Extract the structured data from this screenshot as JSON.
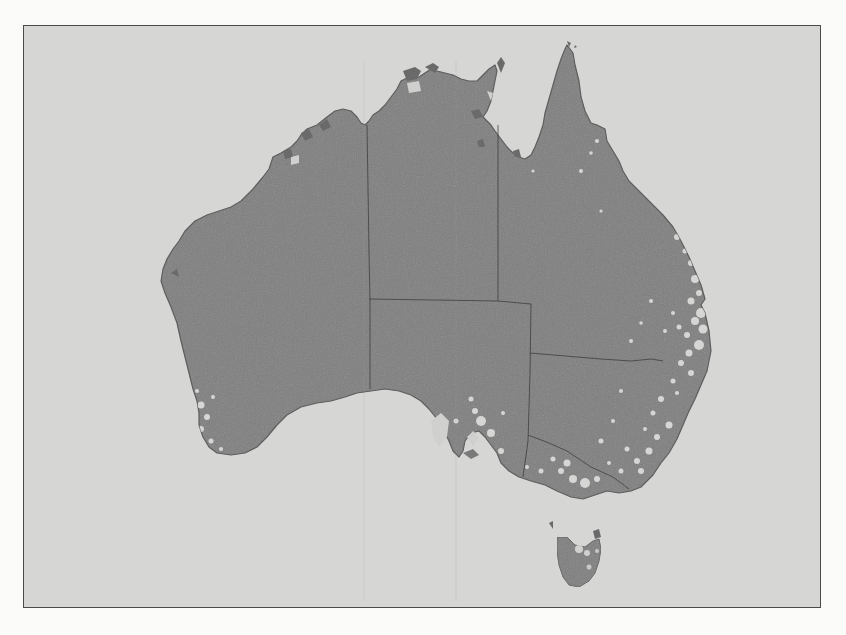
{
  "page": {
    "type": "scanned-document-page",
    "background_color": "#fbfbfa"
  },
  "figure": {
    "frame": {
      "left": 23,
      "top": 25,
      "right": 821,
      "bottom": 608,
      "border_color": "#4a4a4a"
    },
    "colors": {
      "ocean": "#d6d6d4",
      "land": "#7f7f7f",
      "land_dark_edge": "#5a5a5a",
      "highlight_speckle": "#e6e6e4",
      "border_line": "#3c3c3c"
    },
    "regions": [
      {
        "id": "mainland",
        "label": "Australia mainland"
      },
      {
        "id": "tasmania",
        "label": "Tasmania"
      }
    ],
    "state_borders": [
      {
        "id": "wa-border",
        "label": "Western Australia border (129°E)"
      },
      {
        "id": "nt-qld-border",
        "label": "Northern Territory / Queensland border"
      },
      {
        "id": "nt-sa-border",
        "label": "Northern Territory / South Australia border (26°S)"
      },
      {
        "id": "sa-qld-nsw-border",
        "label": "South Australia eastern border"
      },
      {
        "id": "qld-nsw-border",
        "label": "Queensland / New South Wales border"
      },
      {
        "id": "nsw-vic-border",
        "label": "New South Wales / Victoria border"
      }
    ],
    "shading_note": "Light speckles concentrated along the east and south-east coasts, south-west corner and Tasmania"
  },
  "caption": {
    "visible_fragment": ""
  }
}
